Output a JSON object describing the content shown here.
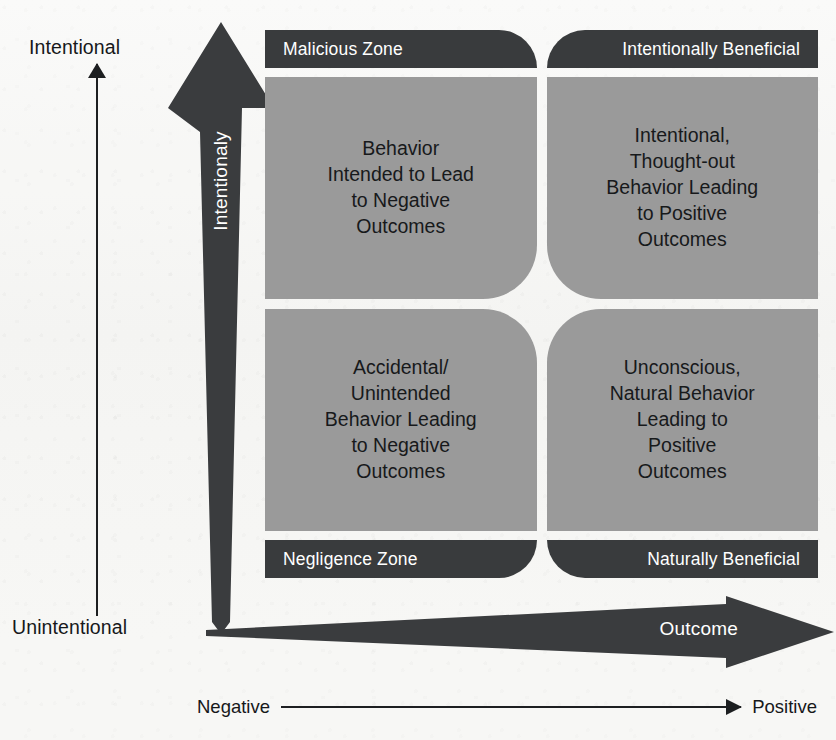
{
  "figure": {
    "kind": "two-by-two-matrix",
    "colors": {
      "band_dark": "#393b3d",
      "quadrant_gray": "#9a9a9a",
      "arrow_dark": "#3a3c3e",
      "text_dark": "#16181a",
      "text_light": "#ffffff",
      "paper": "#f7f7f5"
    }
  },
  "y_axis": {
    "top_label": "Intentional",
    "bottom_label": "Unintentional",
    "arrow_label": "Intentionaly",
    "direction": "up"
  },
  "x_axis": {
    "arrow_label": "Outcome",
    "left_label": "Negative",
    "right_label": "Positive",
    "direction": "right"
  },
  "quadrants": [
    {
      "id": "top-left",
      "band": "Malicious Zone",
      "band_position": "top",
      "lines": [
        "Behavior",
        "Intended to Lead",
        "to Negative",
        "Outcomes"
      ],
      "intent": "Intentional",
      "outcome": "Negative"
    },
    {
      "id": "top-right",
      "band": "Intentionally Beneficial",
      "band_position": "top",
      "lines": [
        "Intentional,",
        "Thought-out",
        "Behavior Leading",
        "to Positive",
        "Outcomes"
      ],
      "intent": "Intentional",
      "outcome": "Positive"
    },
    {
      "id": "bottom-left",
      "band": "Negligence Zone",
      "band_position": "bottom",
      "lines": [
        "Accidental/",
        "Unintended",
        "Behavior Leading",
        "to Negative",
        "Outcomes"
      ],
      "intent": "Unintentional",
      "outcome": "Negative"
    },
    {
      "id": "bottom-right",
      "band": "Naturally Beneficial",
      "band_position": "bottom",
      "lines": [
        "Unconscious,",
        "Natural Behavior",
        "Leading to",
        "Positive",
        "Outcomes"
      ],
      "intent": "Unintentional",
      "outcome": "Positive"
    }
  ]
}
